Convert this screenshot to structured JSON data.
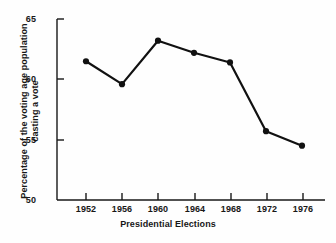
{
  "chart_data": {
    "type": "line",
    "title": "",
    "xlabel": "Presidential Elections",
    "ylabel_line1": "Percentage of the voting age population",
    "ylabel_line2": "casting a vote",
    "categories": [
      "1952",
      "1956",
      "1960",
      "1964",
      "1968",
      "1972",
      "1976"
    ],
    "values": [
      61.5,
      59.6,
      63.2,
      62.2,
      61.4,
      55.7,
      54.5
    ],
    "xticklabels": [
      "1952",
      "1956",
      "1960",
      "1964",
      "1968",
      "1972",
      "1976"
    ],
    "yticklabels": [
      "65",
      "60",
      "55",
      "50"
    ],
    "yticks": [
      65,
      60,
      55,
      50
    ],
    "ylim": [
      50,
      65
    ],
    "grid": false,
    "legend": false,
    "line_color": "#111111",
    "marker": "circle",
    "marker_color": "#111111",
    "background_color": "#fefefe"
  }
}
